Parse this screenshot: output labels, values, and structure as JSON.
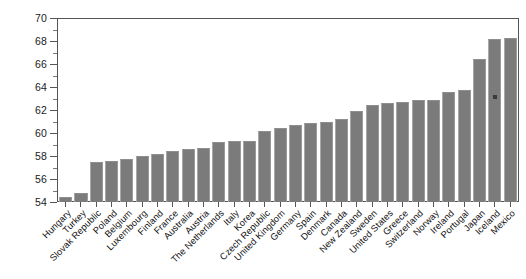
{
  "chart_data": {
    "type": "bar",
    "title": "",
    "subtitle": "",
    "xlabel": "",
    "ylabel": "",
    "ylim": [
      54,
      70
    ],
    "y_ticks": [
      54,
      56,
      58,
      60,
      62,
      64,
      66,
      68,
      70
    ],
    "y_minor_tick_step": 1,
    "grid": false,
    "legend": null,
    "bar_color": "#7b7b7b",
    "axis_color": "#555555",
    "background": "#ffffff",
    "orientation": "vertical",
    "sorted": "ascending",
    "annotations": [
      {
        "label": "marker-dot",
        "category": "Iceland",
        "value": 63.3
      }
    ],
    "categories": [
      "Hungary",
      "Turkey",
      "Slovak Republic",
      "Poland",
      "Belgium",
      "Luxembourg",
      "Finland",
      "France",
      "Australia",
      "Austria",
      "The Netherlands",
      "Italy",
      "Korea",
      "Czech Republic",
      "United Kingdom",
      "Germany",
      "Spain",
      "Denmark",
      "Canada",
      "New Zealand",
      "Sweden",
      "United States",
      "Greece",
      "Switzerland",
      "Norway",
      "Ireland",
      "Portugal",
      "Japan",
      "Iceland",
      "Mexico"
    ],
    "values": [
      54.4,
      54.8,
      57.5,
      57.6,
      57.7,
      58.0,
      58.2,
      58.4,
      58.6,
      58.7,
      59.2,
      59.3,
      59.3,
      60.2,
      60.4,
      60.7,
      60.9,
      61.0,
      61.2,
      61.9,
      62.4,
      62.6,
      62.7,
      62.9,
      62.9,
      63.6,
      63.7,
      66.4,
      68.2,
      68.3
    ]
  }
}
